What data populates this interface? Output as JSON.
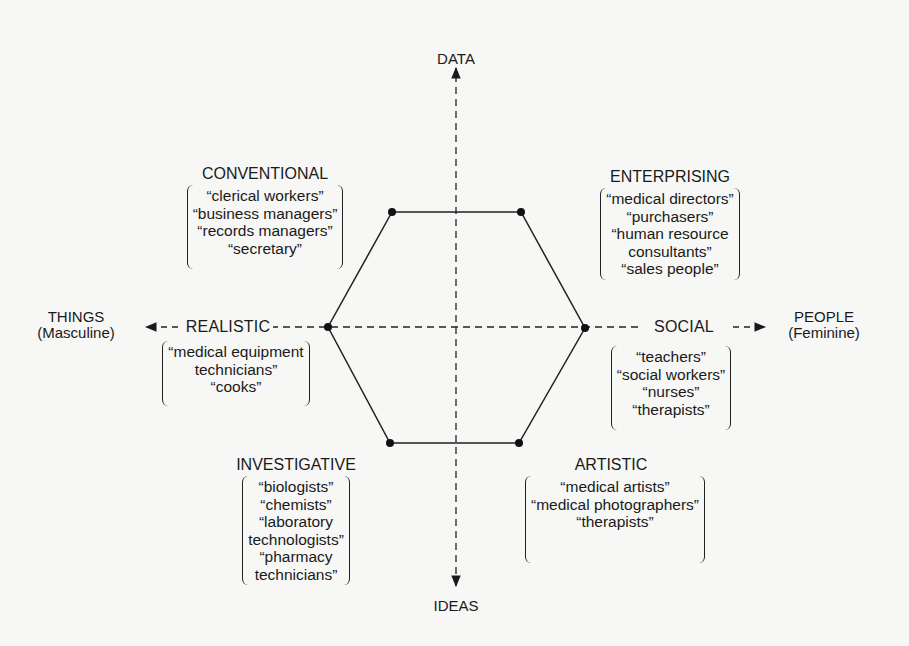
{
  "diagram": {
    "type": "hexagon-model",
    "axes": {
      "top": {
        "label": "DATA"
      },
      "bottom": {
        "label": "IDEAS"
      },
      "left": {
        "label": "THINGS",
        "sublabel": "(Masculine)"
      },
      "right": {
        "label": "PEOPLE",
        "sublabel": "(Feminine)"
      }
    },
    "types": [
      {
        "name": "CONVENTIONAL",
        "examples": [
          "“clerical workers”",
          "“business managers”",
          "“records managers”",
          "“secretary”"
        ]
      },
      {
        "name": "ENTERPRISING",
        "examples": [
          "“medical directors”",
          "“purchasers”",
          "“human resource",
          "consultants”",
          "“sales people”"
        ]
      },
      {
        "name": "REALISTIC",
        "examples": [
          "“medical equipment",
          "technicians”",
          "“cooks”"
        ]
      },
      {
        "name": "SOCIAL",
        "examples": [
          "“teachers”",
          "“social workers”",
          "“nurses”",
          "“therapists”"
        ]
      },
      {
        "name": "INVESTIGATIVE",
        "examples": [
          "“biologists”",
          "“chemists”",
          "“laboratory",
          "technologists”",
          "“pharmacy",
          "technicians”"
        ]
      },
      {
        "name": "ARTISTIC",
        "examples": [
          "“medical artists”",
          "“medical photographers”",
          "“therapists”"
        ]
      }
    ],
    "colors": {
      "ink": "#1a1a1a",
      "paper": "#f7f7f5"
    }
  }
}
